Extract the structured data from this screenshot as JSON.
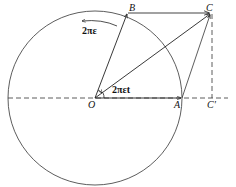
{
  "figure": {
    "points": {
      "O": {
        "label": "O",
        "x": 95,
        "y": 98
      },
      "A": {
        "label": "A",
        "x": 182,
        "y": 98
      },
      "B": {
        "label": "B",
        "x": 128,
        "y": 12
      },
      "C": {
        "label": "C",
        "x": 211,
        "y": 12
      },
      "C_prime": {
        "label": "C'",
        "x": 211,
        "y": 98
      }
    },
    "circle": {
      "cx": 95,
      "cy": 98,
      "r": 87
    },
    "rotation_label": "2πε",
    "angle_label": "2πεt",
    "colors": {
      "stroke": "#222222",
      "background": "#ffffff"
    }
  }
}
